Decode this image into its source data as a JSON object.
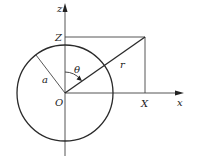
{
  "diagram": {
    "type": "geometry",
    "colors": {
      "line": "#2a2a2a",
      "axis": "#555555",
      "background": "#ffffff"
    },
    "labels": {
      "z_axis": "z",
      "x_axis": "x",
      "Z_projection": "Z",
      "X_projection": "X",
      "origin": "O",
      "radius_sphere": "a",
      "distance": "r",
      "angle": "θ"
    },
    "geometry": {
      "origin": [
        65,
        93
      ],
      "circle_radius": 48,
      "point": [
        145,
        37
      ],
      "x_axis_end": [
        183,
        93
      ],
      "z_axis_top": [
        65,
        3
      ],
      "z_axis_bottom": [
        65,
        156
      ]
    }
  }
}
